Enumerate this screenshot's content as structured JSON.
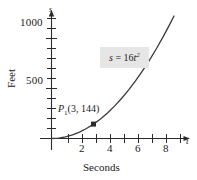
{
  "chart_data": {
    "type": "line",
    "title": "",
    "equation_label": {
      "lhs": "s",
      "operator": " = ",
      "coefficient": "16",
      "variable": "t",
      "exponent": "2",
      "full": "s = 16t²"
    },
    "xlabel": "Seconds",
    "ylabel": "Feet",
    "x_axis_symbol": "t",
    "y_axis_symbol": "s",
    "xlim": [
      -0.6,
      9.4
    ],
    "ylim": [
      -90,
      1250
    ],
    "x_ticks_major": [
      2,
      4,
      6,
      8
    ],
    "x_ticks_minor": [
      1,
      3,
      5,
      7,
      9
    ],
    "x_tick_labels": [
      "2",
      "4",
      "6",
      "8"
    ],
    "y_ticks_major": [
      500,
      1000
    ],
    "y_ticks_minor": [
      100,
      200,
      300,
      400,
      600,
      700,
      800,
      900,
      1100,
      1200
    ],
    "y_tick_labels": [
      "500",
      "1000"
    ],
    "grid": false,
    "legend": "none",
    "curve": {
      "name": "s = 16t^2",
      "color": "#3a3a3a",
      "x": [
        0,
        0.5,
        1,
        1.5,
        2,
        2.5,
        3,
        3.5,
        4,
        4.5,
        5,
        5.5,
        6,
        6.5,
        7,
        7.5,
        8,
        8.5,
        8.75
      ],
      "y": [
        0,
        4,
        16,
        36,
        64,
        100,
        144,
        196,
        256,
        324,
        400,
        484,
        576,
        676,
        784,
        900,
        1024,
        1156,
        1225
      ]
    },
    "annotations": [
      {
        "name": "P1",
        "label": "P₁(3, 144)",
        "label_base": "P",
        "label_subscript": "1",
        "label_coords": "(3, 144)",
        "x": 3,
        "y": 144,
        "marker": "square",
        "marker_color": "#2b2b2b"
      }
    ],
    "colors": {
      "curve": "#3a3a3a",
      "axis": "#2b2b2b",
      "text": "#1a1a1a",
      "equation_box_bg": "#e6e6e6",
      "marker": "#2b2b2b"
    }
  }
}
